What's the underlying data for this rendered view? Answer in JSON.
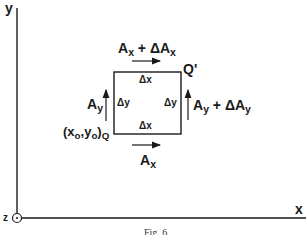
{
  "figure": {
    "caption": "Fig. 6",
    "axes": {
      "x_label": "x",
      "y_label": "y",
      "z_label": "z",
      "z_symbol": "out-of-page (dot in circle)"
    },
    "element": {
      "corner_origin_label": "(x",
      "corner_origin_sub_x": "o",
      "corner_origin_mid": ",y",
      "corner_origin_sub_y": "o",
      "corner_origin_close": ")",
      "corner_origin_point": "Q",
      "corner_opposite_point": "Q'",
      "side_top": "Δx",
      "side_bottom": "Δx",
      "side_left": "Δy",
      "side_right": "Δy"
    },
    "vectors": {
      "bottom": {
        "main": "A",
        "sub": "x",
        "suffix": ""
      },
      "top": {
        "main": "A",
        "sub": "x",
        "plus": " + ΔA",
        "sub2": "x"
      },
      "left": {
        "main": "A",
        "sub": "y"
      },
      "right": {
        "main": "A",
        "sub": "y",
        "plus": " + ΔA",
        "sub2": "y"
      }
    },
    "colors": {
      "ink": "#1a1a1a",
      "background": "#ffffff"
    }
  }
}
